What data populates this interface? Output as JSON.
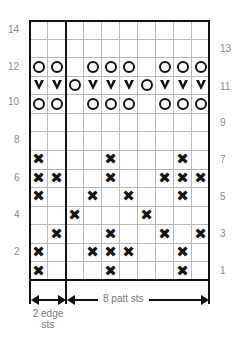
{
  "chart": {
    "rows": 14,
    "cols": 10,
    "left_labels": [
      "14",
      "12",
      "10",
      "8",
      "6",
      "4",
      "2"
    ],
    "right_labels": [
      "13",
      "11",
      "9",
      "7",
      "5",
      "3",
      "1"
    ],
    "legend_symbols": {
      "O": "circle",
      "V": "v-shape",
      "X": "cross"
    },
    "grid": [
      {
        "row": 14,
        "cells": [
          "",
          "",
          "",
          "",
          "",
          "",
          "",
          "",
          "",
          ""
        ]
      },
      {
        "row": 13,
        "cells": [
          "",
          "",
          "",
          "",
          "",
          "",
          "",
          "",
          "",
          ""
        ]
      },
      {
        "row": 12,
        "cells": [
          "O",
          "O",
          "",
          "O",
          "O",
          "O",
          "",
          "O",
          "O",
          "O"
        ]
      },
      {
        "row": 11,
        "cells": [
          "V",
          "V",
          "O",
          "V",
          "V",
          "V",
          "O",
          "V",
          "V",
          "V"
        ]
      },
      {
        "row": 10,
        "cells": [
          "O",
          "O",
          "",
          "O",
          "O",
          "O",
          "",
          "O",
          "O",
          "O"
        ]
      },
      {
        "row": 9,
        "cells": [
          "",
          "",
          "",
          "",
          "",
          "",
          "",
          "",
          "",
          ""
        ]
      },
      {
        "row": 8,
        "cells": [
          "",
          "",
          "",
          "",
          "",
          "",
          "",
          "",
          "",
          ""
        ]
      },
      {
        "row": 7,
        "cells": [
          "X",
          "",
          "",
          "",
          "X",
          "",
          "",
          "",
          "X",
          ""
        ]
      },
      {
        "row": 6,
        "cells": [
          "X",
          "X",
          "",
          "",
          "X",
          "",
          "",
          "X",
          "X",
          "X"
        ]
      },
      {
        "row": 5,
        "cells": [
          "X",
          "",
          "",
          "X",
          "",
          "X",
          "",
          "",
          "X",
          ""
        ]
      },
      {
        "row": 4,
        "cells": [
          "",
          "",
          "X",
          "",
          "",
          "",
          "X",
          "",
          "",
          ""
        ]
      },
      {
        "row": 3,
        "cells": [
          "",
          "X",
          "",
          "",
          "X",
          "",
          "",
          "X",
          "",
          "X"
        ]
      },
      {
        "row": 2,
        "cells": [
          "X",
          "",
          "",
          "X",
          "X",
          "X",
          "",
          "",
          "X",
          ""
        ]
      },
      {
        "row": 1,
        "cells": [
          "X",
          "",
          "",
          "",
          "X",
          "",
          "",
          "",
          "X",
          ""
        ]
      }
    ]
  },
  "annotations": {
    "edge_line1": "2 edge",
    "edge_line2": "sts",
    "pattern": "8 patt sts"
  }
}
